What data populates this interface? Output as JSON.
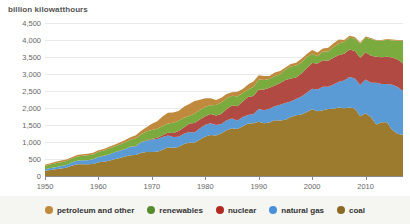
{
  "chart_data": {
    "type": "area",
    "stacked": true,
    "title": "billion kilowatthours",
    "xlabel": "",
    "ylabel": "billion kilowatthours",
    "ylim": [
      0,
      4500
    ],
    "xlim": [
      1950,
      2017
    ],
    "grid": true,
    "legend_position": "bottom",
    "ytick_labels": [
      "4,500",
      "4,000",
      "3,500",
      "3,000",
      "2,500",
      "2,000",
      "1,500",
      "1,000",
      "500",
      "0"
    ],
    "ytick_values": [
      4500,
      4000,
      3500,
      3000,
      2500,
      2000,
      1500,
      1000,
      500,
      0
    ],
    "xtick_labels": [
      "1950",
      "1960",
      "1970",
      "1980",
      "1990",
      "2000",
      "2010"
    ],
    "xtick_values": [
      1950,
      1960,
      1970,
      1980,
      1990,
      2000,
      2010
    ],
    "x": [
      1950,
      1951,
      1952,
      1953,
      1954,
      1955,
      1956,
      1957,
      1958,
      1959,
      1960,
      1961,
      1962,
      1963,
      1964,
      1965,
      1966,
      1967,
      1968,
      1969,
      1970,
      1971,
      1972,
      1973,
      1974,
      1975,
      1976,
      1977,
      1978,
      1979,
      1980,
      1981,
      1982,
      1983,
      1984,
      1985,
      1986,
      1987,
      1988,
      1989,
      1990,
      1991,
      1992,
      1993,
      1994,
      1995,
      1996,
      1997,
      1998,
      1999,
      2000,
      2001,
      2002,
      2003,
      2004,
      2005,
      2006,
      2007,
      2008,
      2009,
      2010,
      2011,
      2012,
      2013,
      2014,
      2015,
      2016,
      2017
    ],
    "stack_order_bottom_to_top": [
      "coal",
      "natural gas",
      "nuclear",
      "renewables",
      "petroleum and other"
    ],
    "series": [
      {
        "name": "coal",
        "color": "#9c7a2e",
        "values": [
          155,
          178,
          195,
          219,
          239,
          301,
          345,
          346,
          344,
          356,
          403,
          422,
          450,
          494,
          526,
          571,
          613,
          616,
          684,
          706,
          704,
          713,
          771,
          848,
          828,
          853,
          944,
          985,
          976,
          1075,
          1162,
          1203,
          1192,
          1259,
          1342,
          1402,
          1386,
          1464,
          1541,
          1554,
          1594,
          1551,
          1576,
          1639,
          1635,
          1653,
          1737,
          1788,
          1807,
          1881,
          1966,
          1904,
          1933,
          1974,
          1978,
          2013,
          1991,
          2016,
          1986,
          1756,
          1847,
          1733,
          1514,
          1581,
          1582,
          1352,
          1239,
          1206
        ]
      },
      {
        "name": "natural gas",
        "color": "#5b9bd5",
        "values": [
          45,
          57,
          66,
          75,
          88,
          95,
          104,
          114,
          121,
          137,
          158,
          169,
          184,
          202,
          220,
          222,
          250,
          262,
          306,
          333,
          373,
          374,
          376,
          341,
          320,
          300,
          295,
          306,
          305,
          329,
          346,
          346,
          305,
          274,
          297,
          292,
          249,
          273,
          253,
          267,
          373,
          382,
          404,
          415,
          460,
          497,
          456,
          480,
          532,
          571,
          601,
          639,
          691,
          650,
          710,
          761,
          816,
          897,
          883,
          921,
          988,
          1013,
          1225,
          1124,
          1126,
          1335,
          1378,
          1296
        ]
      },
      {
        "name": "nuclear",
        "color": "#b04a42",
        "values": [
          0,
          0,
          0,
          0,
          0,
          0,
          0,
          0,
          0,
          0,
          1,
          2,
          2,
          3,
          3,
          4,
          6,
          8,
          13,
          14,
          22,
          38,
          54,
          83,
          114,
          173,
          191,
          251,
          276,
          255,
          251,
          273,
          283,
          294,
          328,
          384,
          414,
          455,
          527,
          529,
          577,
          613,
          619,
          610,
          640,
          673,
          675,
          629,
          674,
          728,
          754,
          769,
          780,
          764,
          789,
          782,
          787,
          806,
          806,
          799,
          807,
          790,
          769,
          789,
          797,
          797,
          806,
          805
        ]
      },
      {
        "name": "renewables",
        "color": "#7bab3e",
        "values": [
          101,
          106,
          113,
          113,
          111,
          117,
          127,
          137,
          145,
          142,
          149,
          154,
          173,
          170,
          178,
          197,
          196,
          223,
          223,
          253,
          251,
          266,
          273,
          272,
          304,
          300,
          284,
          221,
          283,
          280,
          279,
          261,
          310,
          333,
          323,
          284,
          291,
          250,
          223,
          268,
          292,
          279,
          252,
          280,
          259,
          310,
          356,
          356,
          323,
          319,
          278,
          211,
          261,
          276,
          315,
          341,
          349,
          347,
          371,
          414,
          427,
          493,
          474,
          482,
          500,
          504,
          556,
          667
        ]
      },
      {
        "name": "petroleum and other",
        "color": "#c08a3e",
        "values": [
          33,
          37,
          42,
          47,
          47,
          37,
          40,
          41,
          41,
          47,
          48,
          49,
          50,
          51,
          55,
          65,
          76,
          90,
          105,
          126,
          184,
          220,
          274,
          314,
          301,
          289,
          320,
          358,
          365,
          304,
          246,
          206,
          147,
          144,
          120,
          100,
          137,
          118,
          149,
          158,
          127,
          118,
          89,
          100,
          91,
          60,
          67,
          78,
          110,
          86,
          106,
          112,
          85,
          110,
          110,
          118,
          60,
          62,
          42,
          35,
          33,
          27,
          20,
          23,
          27,
          26,
          24,
          22
        ]
      }
    ]
  },
  "legend": {
    "items": [
      {
        "label": "petroleum and other",
        "color": "#c08a3e",
        "dot_name": "legend-dot-petroleum"
      },
      {
        "label": "renewables",
        "color": "#558c2f",
        "dot_name": "legend-dot-renewables"
      },
      {
        "label": "nuclear",
        "color": "#b02a22",
        "dot_name": "legend-dot-nuclear"
      },
      {
        "label": "natural gas",
        "color": "#4a90d9",
        "dot_name": "legend-dot-natural-gas"
      },
      {
        "label": "coal",
        "color": "#8a6a24",
        "dot_name": "legend-dot-coal"
      }
    ]
  },
  "colors": {
    "background": "#ffffff",
    "legend_background": "#f5f5f2",
    "gridline": "#e9e9e9",
    "axis": "#8a8a8a",
    "tick_text": "#666666",
    "title_text": "#555555"
  }
}
